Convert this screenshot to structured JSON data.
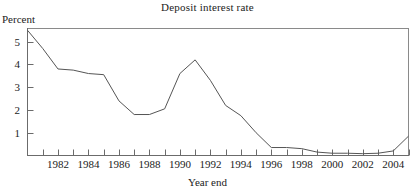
{
  "chart_data": {
    "type": "line",
    "title": "Deposit interest rate",
    "xlabel": "Year end",
    "ylabel": "Percent",
    "grid": false,
    "legend": false,
    "xlim": [
      1980,
      2005
    ],
    "ylim": [
      0,
      5.6
    ],
    "y_ticks": [
      1,
      2,
      3,
      4,
      5
    ],
    "y_tick_labels": [
      "1",
      "2",
      "3",
      "4",
      "5"
    ],
    "x_ticks": [
      1981,
      1982,
      1983,
      1984,
      1985,
      1986,
      1987,
      1988,
      1989,
      1990,
      1991,
      1992,
      1993,
      1994,
      1995,
      1996,
      1997,
      1998,
      1999,
      2000,
      2001,
      2002,
      2003,
      2004,
      2005
    ],
    "x_tick_labels": [
      "1982",
      "1984",
      "1986",
      "1988",
      "1990",
      "1992",
      "1994",
      "1996",
      "1998",
      "2000",
      "2002",
      "2004"
    ],
    "x_labeled_ticks": [
      1982,
      1984,
      1986,
      1988,
      1990,
      1992,
      1994,
      1996,
      1998,
      2000,
      2002,
      2004
    ],
    "x": [
      1980,
      1981,
      1982,
      1983,
      1984,
      1985,
      1986,
      1987,
      1988,
      1989,
      1990,
      1991,
      1992,
      1993,
      1994,
      1995,
      1996,
      1997,
      1998,
      1999,
      2000,
      2001,
      2002,
      2003,
      2004,
      2005
    ],
    "values": [
      5.5,
      4.7,
      3.8,
      3.75,
      3.6,
      3.55,
      2.4,
      1.8,
      1.8,
      2.05,
      3.6,
      4.2,
      3.3,
      2.2,
      1.75,
      1.0,
      0.35,
      0.35,
      0.3,
      0.15,
      0.1,
      0.1,
      0.08,
      0.1,
      0.2,
      0.85
    ],
    "series_name": "Deposit interest rate",
    "line_color": "#555555",
    "axis_color": "#808080"
  }
}
